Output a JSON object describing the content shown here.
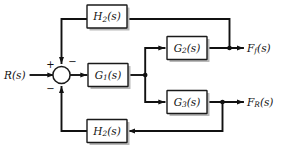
{
  "diagram": {
    "type": "block-diagram",
    "background_color": "#ffffff",
    "line_color": "#111111",
    "block_fill": "#ffffff",
    "block_stroke": "#1a1a1a",
    "shadow_color": "#b9b9b9"
  },
  "inputs": [
    {
      "id": "input-r",
      "label": "R",
      "subscript": "",
      "arg": "(s)",
      "full": "R(s)"
    }
  ],
  "outputs": [
    {
      "id": "output-ff",
      "label": "F",
      "subscript": "f",
      "arg": "(s)",
      "full": "F_f(s)"
    },
    {
      "id": "output-fr",
      "label": "F",
      "subscript": "R",
      "arg": "(s)",
      "full": "F_R(s)"
    }
  ],
  "blocks": [
    {
      "id": "block-h2-top",
      "label": "H",
      "subscript": "2",
      "arg": "(s)",
      "full": "H2(s)"
    },
    {
      "id": "block-g1",
      "label": "G",
      "subscript": "1",
      "arg": "(s)",
      "full": "G1(s)"
    },
    {
      "id": "block-g2",
      "label": "G",
      "subscript": "2",
      "arg": "(s)",
      "full": "G2(s)"
    },
    {
      "id": "block-g3",
      "label": "G",
      "subscript": "3",
      "arg": "(s)",
      "full": "G3(s)"
    },
    {
      "id": "block-h2-bottom",
      "label": "H",
      "subscript": "2",
      "arg": "(s)",
      "full": "H2(s)"
    }
  ],
  "summing_junction": {
    "id": "summing-junction",
    "signs": [
      {
        "id": "sign-input",
        "symbol": "+",
        "position": "left"
      },
      {
        "id": "sign-feedback-top",
        "symbol": "−",
        "position": "top-right"
      },
      {
        "id": "sign-feedback-bottom",
        "symbol": "−",
        "position": "bottom-left"
      }
    ]
  },
  "junction_dots": [
    {
      "id": "branch-g1-output",
      "note": "G1 output splits to G2 and G3"
    },
    {
      "id": "tap-g2-output",
      "note": "G2 output tap feeding top H2 feedback"
    },
    {
      "id": "tap-g3-output",
      "note": "G3 output tap feeding bottom H2 feedback"
    }
  ]
}
